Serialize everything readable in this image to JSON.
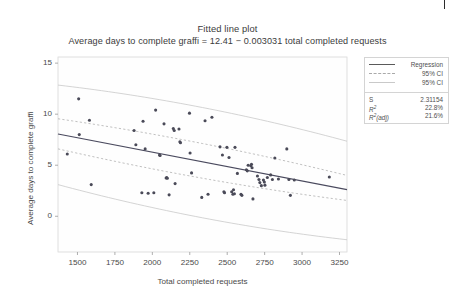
{
  "figure": {
    "background": "#ffffff",
    "corner_mark": "|"
  },
  "legend": {
    "keys": [
      {
        "label": "Regression",
        "style": "solid",
        "color": "#5a5a5a"
      },
      {
        "label": "95% CI",
        "style": "dash",
        "color": "#a9a9a9"
      },
      {
        "label": "95% CI",
        "style": "plain",
        "color": "#c9c9c9"
      }
    ],
    "stats": [
      {
        "key": "S",
        "value": "2.31154",
        "sup": ""
      },
      {
        "key": "R",
        "value": "22.8%",
        "sup": "2"
      },
      {
        "key": "R",
        "value": "21.6%",
        "sup": "2",
        "suffix": "(adj)"
      }
    ]
  },
  "chart_data": {
    "type": "scatter",
    "title": "Fitted line plot",
    "subtitle": "Average days to complete graffi = 12.41 − 0.003031 total completed requests",
    "xlabel": "Total completed requests",
    "ylabel": "Average days to complete graffi",
    "xlim": [
      1370,
      3300
    ],
    "ylim": [
      -3.5,
      15.6
    ],
    "xticks": [
      1500,
      1750,
      2000,
      2250,
      2500,
      2750,
      3000,
      3250
    ],
    "yticks": [
      0,
      5,
      10,
      15
    ],
    "grid": false,
    "legend_position": "outside-right-top",
    "fit": {
      "intercept": 12.41,
      "slope": -0.003031,
      "s": "2.31154",
      "r_squared": "22.8%",
      "r_squared_adj": "21.6%"
    },
    "series": [
      {
        "name": "Data",
        "marker": "filled-circle",
        "color": "#4a4a58",
        "points": [
          [
            1432,
            6.1
          ],
          [
            1508,
            11.5
          ],
          [
            1512,
            8.0
          ],
          [
            1580,
            9.4
          ],
          [
            1592,
            3.1
          ],
          [
            1878,
            8.4
          ],
          [
            1890,
            7.0
          ],
          [
            1930,
            2.3
          ],
          [
            1938,
            9.3
          ],
          [
            1952,
            6.6
          ],
          [
            1972,
            2.25
          ],
          [
            2010,
            2.3
          ],
          [
            2022,
            10.4
          ],
          [
            2048,
            6.0
          ],
          [
            2052,
            5.95
          ],
          [
            2078,
            9.05
          ],
          [
            2092,
            3.75
          ],
          [
            2096,
            3.8
          ],
          [
            2100,
            3.72
          ],
          [
            2112,
            2.1
          ],
          [
            2140,
            8.6
          ],
          [
            2146,
            8.4
          ],
          [
            2152,
            3.2
          ],
          [
            2178,
            8.55
          ],
          [
            2184,
            7.3
          ],
          [
            2188,
            7.2
          ],
          [
            2248,
            10.1
          ],
          [
            2252,
            6.2
          ],
          [
            2262,
            4.25
          ],
          [
            2330,
            1.85
          ],
          [
            2352,
            9.35
          ],
          [
            2372,
            2.15
          ],
          [
            2398,
            9.7
          ],
          [
            2452,
            6.8
          ],
          [
            2468,
            6.0
          ],
          [
            2478,
            2.4
          ],
          [
            2482,
            2.3
          ],
          [
            2498,
            6.75
          ],
          [
            2512,
            5.75
          ],
          [
            2530,
            2.4
          ],
          [
            2538,
            2.15
          ],
          [
            2542,
            2.6
          ],
          [
            2548,
            2.2
          ],
          [
            2552,
            6.75
          ],
          [
            2568,
            4.2
          ],
          [
            2592,
            2.15
          ],
          [
            2598,
            2.05
          ],
          [
            2628,
            4.55
          ],
          [
            2634,
            4.45
          ],
          [
            2640,
            5.0
          ],
          [
            2658,
            4.95
          ],
          [
            2662,
            5.1
          ],
          [
            2666,
            4.75
          ],
          [
            2672,
            1.7
          ],
          [
            2702,
            3.95
          ],
          [
            2712,
            3.6
          ],
          [
            2718,
            3.3
          ],
          [
            2728,
            3.0
          ],
          [
            2742,
            3.55
          ],
          [
            2748,
            3.35
          ],
          [
            2752,
            3.05
          ],
          [
            2768,
            3.8
          ],
          [
            2790,
            4.05
          ],
          [
            2802,
            3.6
          ],
          [
            2818,
            5.7
          ],
          [
            2842,
            3.65
          ],
          [
            2898,
            6.6
          ],
          [
            2912,
            3.6
          ],
          [
            2922,
            2.05
          ],
          [
            2948,
            3.55
          ],
          [
            3182,
            3.85
          ]
        ]
      }
    ],
    "lines": [
      {
        "name": "Regression",
        "style": "solid",
        "color": "#4a4a5e",
        "y_at_xmin": 8.06,
        "y_at_xmax": 2.61
      },
      {
        "name": "95% CI upper",
        "style": "dashed",
        "color": "#b0b0b0",
        "y_at_xmin": 9.55,
        "y_at_xmax": 4.0
      },
      {
        "name": "95% CI lower",
        "style": "dashed",
        "color": "#b0b0b0",
        "y_at_xmin": 6.6,
        "y_at_xmax": 1.55
      },
      {
        "name": "95% PI upper",
        "style": "solid-light",
        "color": "#c9c9c9",
        "y_at_xmin": 12.85,
        "y_at_xmax": 7.35
      },
      {
        "name": "95% PI lower",
        "style": "solid-light",
        "color": "#c9c9c9",
        "y_at_xmin": 3.1,
        "y_at_xmax": -2.3
      }
    ]
  }
}
